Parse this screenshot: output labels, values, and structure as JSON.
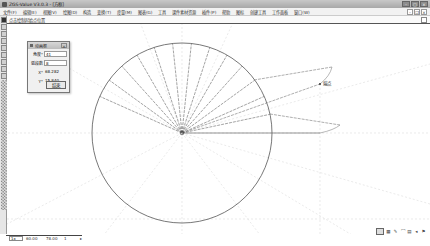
{
  "window": {
    "title": "ZGS-Value V3.0.3 - [方框]",
    "controls": [
      "minimize",
      "maximize",
      "close"
    ]
  },
  "menubar": {
    "items": [
      {
        "label": "文件(F)"
      },
      {
        "label": "编辑(E)"
      },
      {
        "label": "视图(V)"
      },
      {
        "label": "绘图(D)"
      },
      {
        "label": "构造"
      },
      {
        "label": "变换(T)"
      },
      {
        "label": "度量(M)"
      },
      {
        "label": "图表(G)"
      },
      {
        "label": "工具"
      },
      {
        "label": "课件素材资源"
      },
      {
        "label": "插件(P)"
      },
      {
        "label": "帮助"
      },
      {
        "label": "图标"
      },
      {
        "label": "创建工具"
      },
      {
        "label": "工作面板"
      },
      {
        "label": "窗口(W)"
      }
    ],
    "mdi_controls": [
      "minimize",
      "restore",
      "close"
    ]
  },
  "hintbar": {
    "text": "点击绘制起始点位置"
  },
  "dialog": {
    "title": "动画框",
    "close_label": "×",
    "fields": [
      {
        "label": "角度°",
        "value": "41"
      },
      {
        "label": "弧段数",
        "value": "8"
      },
      {
        "label": "X°",
        "value": "68.282"
      },
      {
        "label": "Y°",
        "value": "15.840"
      }
    ],
    "ok_label": "结束"
  },
  "canvas": {
    "point_label": "端点",
    "circle": {
      "cx": 175,
      "cy": 109,
      "r": 90
    },
    "spoke_angles_deg": [
      12,
      24,
      36,
      48,
      60,
      72,
      84,
      96,
      108,
      120,
      132,
      144,
      156
    ],
    "stroke_color": "#555555",
    "guide_color": "#d6d6d6"
  },
  "statusbar": {
    "zoom_combo": "1x",
    "coord_x": "60.00",
    "coord_y": "78.00",
    "extra": "1",
    "arrow": "▸"
  },
  "tray": {
    "icons": [
      "screen-icon",
      "keyboard-icon",
      "pen-icon",
      "network-icon",
      "battery-icon",
      "volume-icon",
      "flag-icon"
    ]
  }
}
